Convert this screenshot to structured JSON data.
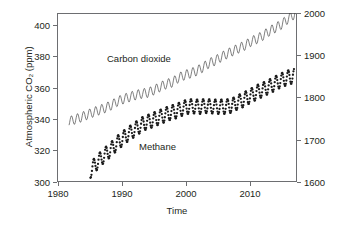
{
  "chart_data": {
    "type": "line",
    "title": "",
    "subtitle": "",
    "xlabel": "Time",
    "ylabel": "Atmospheric CO₂ (ppm)",
    "y2label": "Atmospheric CH₄ (ppb)",
    "xlim": [
      1978.0,
      2017.5
    ],
    "ylim": [
      300,
      408
    ],
    "y2lim": [
      1600,
      2000
    ],
    "grid": false,
    "legend_position": "inline-annotation",
    "xticks": [
      1980,
      1990,
      2000,
      2010
    ],
    "xticklabels": [
      "1980",
      "1990",
      "2000",
      "2010"
    ],
    "yticks": [
      300,
      320,
      340,
      360,
      380,
      400
    ],
    "yticklabels": [
      "300",
      "320",
      "340",
      "360",
      "380",
      "400"
    ],
    "y2ticks": [
      1600,
      1700,
      1800,
      1900,
      2000
    ],
    "y2ticklabels": [
      "1600",
      "1700",
      "1800",
      "1900",
      "2000"
    ],
    "annotations": [
      {
        "text": "Carbon dioxide",
        "x": 1987.8,
        "y": 384
      },
      {
        "text": "Methane",
        "x": 1992.9,
        "y": 328
      }
    ],
    "series": [
      {
        "name": "Carbon dioxide",
        "axis": "left",
        "units": "ppm",
        "style": "continuous-line-with-seasonal-cycle",
        "color": "#3a3a3a",
        "seasonal_amplitude_ppm": 3.1,
        "x": [
          1980.0,
          1981.0,
          1982.0,
          1983.0,
          1984.0,
          1985.0,
          1986.0,
          1987.0,
          1988.0,
          1989.0,
          1990.0,
          1991.0,
          1992.0,
          1993.0,
          1994.0,
          1995.0,
          1996.0,
          1997.0,
          1998.0,
          1999.0,
          2000.0,
          2001.0,
          2002.0,
          2003.0,
          2004.0,
          2005.0,
          2006.0,
          2007.0,
          2008.0,
          2009.0,
          2010.0,
          2011.0,
          2012.0,
          2013.0,
          2014.0,
          2015.0,
          2016.0,
          2017.3
        ],
        "values": [
          338.7,
          340.1,
          341.4,
          343.0,
          344.6,
          346.0,
          347.4,
          349.2,
          351.6,
          353.1,
          354.4,
          355.6,
          356.5,
          357.1,
          358.8,
          360.8,
          362.6,
          363.7,
          366.6,
          368.3,
          369.5,
          371.0,
          373.2,
          375.8,
          377.5,
          379.8,
          381.9,
          383.8,
          385.6,
          387.4,
          389.9,
          391.6,
          393.8,
          396.5,
          398.6,
          400.8,
          404.2,
          407.8
        ]
      },
      {
        "name": "Methane",
        "axis": "right",
        "units": "ppb",
        "style": "dot-markers-with-seasonal-cycle",
        "color": "#1a1a1a",
        "seasonal_amplitude_ppb": 17,
        "x": [
          1983.5,
          1984.0,
          1984.5,
          1985.0,
          1985.5,
          1986.0,
          1986.5,
          1987.0,
          1987.5,
          1988.0,
          1988.5,
          1989.0,
          1989.5,
          1990.0,
          1990.5,
          1991.0,
          1991.5,
          1992.0,
          1992.5,
          1993.0,
          1993.5,
          1994.0,
          1994.5,
          1995.0,
          1995.5,
          1996.0,
          1996.5,
          1997.0,
          1997.5,
          1998.0,
          1998.5,
          1999.0,
          1999.5,
          2000.0,
          2000.5,
          2001.0,
          2001.5,
          2002.0,
          2002.5,
          2003.0,
          2003.5,
          2004.0,
          2004.5,
          2005.0,
          2005.5,
          2006.0,
          2006.5,
          2007.0,
          2007.5,
          2008.0,
          2008.5,
          2009.0,
          2009.5,
          2010.0,
          2010.5,
          2011.0,
          2011.5,
          2012.0,
          2012.5,
          2013.0,
          2013.5,
          2014.0,
          2014.5,
          2015.0,
          2015.5,
          2016.0,
          2016.5,
          2017.0
        ],
        "values": [
          1626,
          1637,
          1644,
          1652,
          1659,
          1666,
          1672,
          1679,
          1686,
          1693,
          1699,
          1705,
          1711,
          1716,
          1721,
          1726,
          1731,
          1736,
          1740,
          1742,
          1745,
          1748,
          1751,
          1754,
          1757,
          1760,
          1763,
          1765,
          1767,
          1770,
          1773,
          1776,
          1778,
          1779,
          1779,
          1778,
          1778,
          1779,
          1780,
          1779,
          1779,
          1778,
          1778,
          1778,
          1778,
          1779,
          1780,
          1782,
          1787,
          1790,
          1793,
          1797,
          1801,
          1805,
          1809,
          1813,
          1816,
          1819,
          1823,
          1826,
          1830,
          1834,
          1838,
          1841,
          1844,
          1847,
          1849,
          1851
        ]
      }
    ]
  }
}
